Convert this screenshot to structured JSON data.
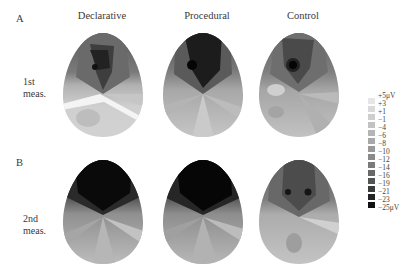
{
  "figure": {
    "columns": [
      "Declarative",
      "Procedural",
      "Control"
    ],
    "panels": [
      {
        "letter": "A",
        "row_label_line1": "1st",
        "row_label_line2": "meas."
      },
      {
        "letter": "B",
        "row_label_line1": "2nd",
        "row_label_line2": "meas."
      }
    ]
  },
  "legend": {
    "labels": [
      "+5μV",
      "+3",
      "+1",
      "−1",
      "−4",
      "−6",
      "−8",
      "−10",
      "−12",
      "−14",
      "−16",
      "−19",
      "−21",
      "−23",
      "−25μV"
    ],
    "swatch_colors": [
      "#e6e6e6",
      "#dadada",
      "#cecece",
      "#c2c2c2",
      "#b5b5b5",
      "#a8a8a8",
      "#999999",
      "#8a8a8a",
      "#7a7a7a",
      "#686868",
      "#545454",
      "#3c3c3c",
      "#242424",
      "#111111"
    ]
  },
  "maps": [
    {
      "panel": "A",
      "condition": "Declarative",
      "frontal_color": "#4a4a4a",
      "peak_color": "#1a1a1a",
      "mid_color": "#9a9a9a",
      "back_color": "#cfcfcf"
    },
    {
      "panel": "A",
      "condition": "Procedural",
      "frontal_color": "#2a2a2a",
      "peak_color": "#0a0a0a",
      "mid_color": "#8c8c8c",
      "back_color": "#c4c4c4"
    },
    {
      "panel": "A",
      "condition": "Control",
      "frontal_color": "#545454",
      "peak_color": "#0c0c0c",
      "mid_color": "#9c9c9c",
      "back_color": "#bdbdbd"
    },
    {
      "panel": "B",
      "condition": "Declarative",
      "frontal_color": "#141414",
      "peak_color": "#050505",
      "mid_color": "#888888",
      "back_color": "#b8b8b8"
    },
    {
      "panel": "B",
      "condition": "Procedural",
      "frontal_color": "#121212",
      "peak_color": "#040404",
      "mid_color": "#8a8a8a",
      "back_color": "#b4b4b4"
    },
    {
      "panel": "B",
      "condition": "Control",
      "frontal_color": "#4e4e4e",
      "peak_color": "#1e1e1e",
      "mid_color": "#a4a4a4",
      "back_color": "#c0c0c0"
    }
  ]
}
